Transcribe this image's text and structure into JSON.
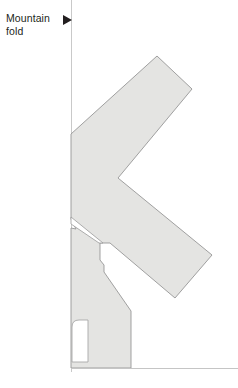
{
  "figure": {
    "kind": "origami-fold-diagram",
    "background_color": "#ffffff",
    "paper_fill_color": "#e4e4e2",
    "paper_stroke_color": "#949494",
    "guide_line_color": "#c9c9c9",
    "text_color": "#231f20"
  },
  "legend": {
    "label": "Mountain\nfold",
    "label_line_1": "Mountain",
    "label_line_2": "fold",
    "marker_icon": "right-triangle-arrow-icon",
    "marker_color": "#231f20"
  },
  "geometry": {
    "vertical_guide_x": 71.5,
    "vertical_guide_y1": 0,
    "vertical_guide_y2": 372,
    "baseline_y": 368.5,
    "baseline_x1": 71.5,
    "baseline_x2": 238,
    "paper_outline_points": "157,56 192,89 118,178 212,255 175,298 110,243 100,243 100,260 104,265 104,272 131,310 131,368 71,368 71,228 75,228 71,219 71,134",
    "notch_cutout_points": "71,219 103,243 100,243 100,239",
    "rounded_cut": {
      "x": 72,
      "y": 320,
      "width": 16,
      "height": 42,
      "corner_radius": 7
    }
  }
}
